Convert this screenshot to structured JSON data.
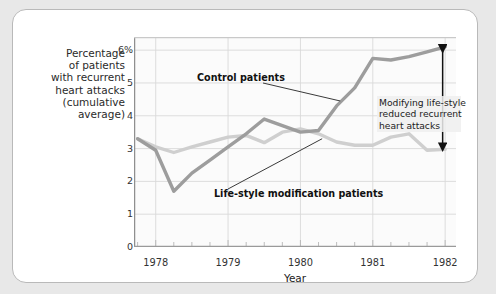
{
  "chart_data": {
    "type": "line",
    "title": "",
    "xlabel": "Year",
    "ylabel_lines": [
      "Percentage",
      "of patients",
      "with recurrent",
      "heart attacks",
      "(cumulative",
      "average)"
    ],
    "ylabel": "Percentage of patients with recurrent heart attacks (cumulative average)",
    "ylim": [
      0,
      6.4
    ],
    "yticks": [
      0,
      1,
      2,
      3,
      4,
      5,
      6
    ],
    "ytick_labels": [
      "0",
      "1",
      "2",
      "3",
      "4",
      "5",
      "6%"
    ],
    "xlim": [
      1977.7,
      1982.15
    ],
    "xticks": [
      1978,
      1979,
      1980,
      1981,
      1982
    ],
    "xtick_labels": [
      "1978",
      "1979",
      "1980",
      "1981",
      "1982"
    ],
    "minor_tick_interval_years": 0.25,
    "grid": "both",
    "legend": "none",
    "series": [
      {
        "name": "Control patients",
        "color": "#9d9d9d",
        "x": [
          1977.75,
          1978.0,
          1978.25,
          1978.5,
          1978.75,
          1979.0,
          1979.25,
          1979.5,
          1979.75,
          1980.0,
          1980.25,
          1980.5,
          1980.75,
          1981.0,
          1981.25,
          1981.5,
          1981.75,
          1982.0
        ],
        "values": [
          3.3,
          2.95,
          1.7,
          2.25,
          2.65,
          3.05,
          3.45,
          3.9,
          3.7,
          3.5,
          3.55,
          4.3,
          4.85,
          5.75,
          5.7,
          5.8,
          5.95,
          6.1
        ]
      },
      {
        "name": "Life-style modification patients",
        "color": "#cfcfcf",
        "x": [
          1977.75,
          1978.0,
          1978.25,
          1978.5,
          1978.75,
          1979.0,
          1979.25,
          1979.5,
          1979.75,
          1980.0,
          1980.25,
          1980.5,
          1980.75,
          1981.0,
          1981.25,
          1981.5,
          1981.75,
          1982.0
        ],
        "values": [
          3.3,
          3.05,
          2.88,
          3.05,
          3.2,
          3.35,
          3.4,
          3.18,
          3.5,
          3.6,
          3.45,
          3.2,
          3.1,
          3.1,
          3.35,
          3.45,
          2.95,
          2.98
        ]
      }
    ],
    "annotations": [
      {
        "id": "control",
        "text": "Control patients",
        "label_xy": [
          184,
          62
        ],
        "leader_to": [
          1980.55,
          4.45
        ]
      },
      {
        "id": "lifestyle",
        "text": "Life-style modification patients",
        "label_xy": [
          201,
          178
        ],
        "leader_to": [
          1980.3,
          3.3
        ]
      },
      {
        "id": "gap",
        "lines": [
          "Modifying life-style",
          "reduced recurrent",
          "heart attacks"
        ],
        "text": "Modifying life-style reduced recurrent heart attacks",
        "arrow": {
          "x_year": 1982.0,
          "y_top": 6.1,
          "y_bottom": 2.98,
          "style": "double-headed",
          "color": "#111111"
        }
      }
    ]
  }
}
